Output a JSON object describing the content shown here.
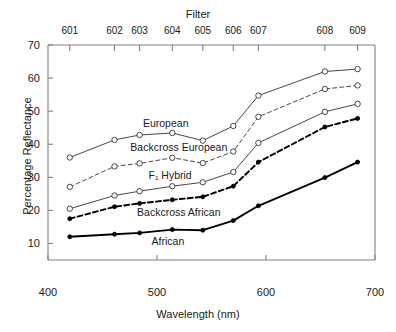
{
  "chart_data": {
    "type": "line",
    "title": "",
    "top_axis_title": "Filter",
    "xlabel": "Wavelength (nm)",
    "ylabel": "Percentage Reflectance",
    "xlim": [
      400,
      700
    ],
    "ylim": [
      5,
      70
    ],
    "xticks": [
      400,
      500,
      600,
      700
    ],
    "yticks": [
      10,
      20,
      30,
      40,
      50,
      60,
      70
    ],
    "grid": false,
    "legend_position": "inline-annotations",
    "filters": {
      "labels": [
        "601",
        "602",
        "603",
        "604",
        "605",
        "606",
        "607",
        "608",
        "609"
      ],
      "wavelengths": [
        420,
        461,
        484,
        514,
        542,
        570,
        593,
        654,
        684
      ]
    },
    "x": [
      420,
      461,
      484,
      514,
      542,
      570,
      593,
      654,
      684
    ],
    "series": [
      {
        "name": "European",
        "marker": "open-circle",
        "line": "solid",
        "values": [
          36.0,
          41.3,
          42.8,
          43.4,
          41.1,
          45.5,
          54.7,
          62.0,
          62.7
        ]
      },
      {
        "name": "Backcross European",
        "marker": "open-circle",
        "line": "dashed",
        "values": [
          27.1,
          33.3,
          34.2,
          35.9,
          34.3,
          37.8,
          48.3,
          56.7,
          57.8
        ]
      },
      {
        "name": "F₁ Hybrid",
        "marker": "open-circle",
        "line": "solid",
        "values": [
          20.5,
          24.5,
          25.8,
          27.3,
          28.5,
          31.6,
          40.4,
          49.8,
          52.2
        ]
      },
      {
        "name": "Backcross African",
        "marker": "filled-circle",
        "line": "dashed-bold",
        "values": [
          17.5,
          21.1,
          22.1,
          23.2,
          24.1,
          27.3,
          34.6,
          45.2,
          47.8
        ]
      },
      {
        "name": "African",
        "marker": "filled-circle",
        "line": "solid-bold",
        "values": [
          12.0,
          12.8,
          13.2,
          14.2,
          14.0,
          16.9,
          21.4,
          29.9,
          34.6
        ]
      }
    ],
    "annotations": [
      {
        "text": "European",
        "x": 508,
        "y": 46.5
      },
      {
        "text": "Backcross European",
        "x": 520,
        "y": 39.3
      },
      {
        "text": "F₁ Hybrid",
        "x": 512,
        "y": 30.6
      },
      {
        "text": "Backcross African",
        "x": 520,
        "y": 19.6
      },
      {
        "text": "African",
        "x": 510,
        "y": 10.8
      }
    ]
  },
  "colors": {
    "axis": "#808080",
    "text": "#1a1a1a",
    "line": "#333333",
    "bold_line": "#000000"
  }
}
